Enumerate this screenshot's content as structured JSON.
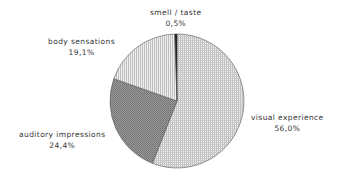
{
  "chart_data": {
    "type": "pie",
    "title": "",
    "categories": [
      "visual experience",
      "auditory impressions",
      "body sensations",
      "smell / taste"
    ],
    "values": [
      56.0,
      24.4,
      19.1,
      0.5
    ],
    "value_labels": [
      "56,0%",
      "24,4%",
      "19,1%",
      "0,5%"
    ],
    "start_angle_deg": 0,
    "direction": "clockwise",
    "fills": [
      "fine-grid",
      "dense-dark-dots",
      "vertical-lines",
      "black"
    ],
    "legend": "none (direct labels)"
  },
  "labels": {
    "visual": {
      "name": "visual experience",
      "value": "56,0%"
    },
    "auditory": {
      "name": "auditory impressions",
      "value": "24,4%"
    },
    "body": {
      "name": "body sensations",
      "value": "19,1%"
    },
    "smell": {
      "name": "smell / taste",
      "value": "0,5%"
    }
  }
}
